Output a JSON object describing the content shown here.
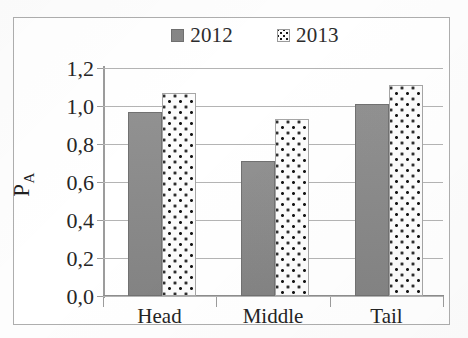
{
  "chart_data": {
    "type": "bar",
    "title": "",
    "subtitle": "",
    "xlabel": "",
    "ylabel": "P_A",
    "ylabel_base": "P",
    "ylabel_sub": "A",
    "categories": [
      "Head",
      "Middle",
      "Tail"
    ],
    "series": [
      {
        "name": "2012",
        "values": [
          0.97,
          0.71,
          1.01
        ],
        "color": "#8a8a8a",
        "pattern": "solid"
      },
      {
        "name": "2013",
        "values": [
          1.07,
          0.93,
          1.11
        ],
        "color": "#fcfcfc",
        "pattern": "dotted"
      }
    ],
    "ylim": [
      0.0,
      1.2
    ],
    "ytick_values": [
      1.2,
      1.0,
      0.8,
      0.6,
      0.4,
      0.2,
      0.0
    ],
    "ytick_labels": [
      "1,2",
      "1,0",
      "0,8",
      "0,6",
      "0,4",
      "0,2",
      "0,0"
    ],
    "decimal_separator": ",",
    "grid": true,
    "grid_axis": "y",
    "legend_position": "top",
    "legend_entries": [
      "2012",
      "2013"
    ],
    "frame": true
  },
  "legend": {
    "items": [
      {
        "label": "2012",
        "swatch": "solid-gray-swatch"
      },
      {
        "label": "2013",
        "swatch": "dotted-pattern-swatch"
      }
    ]
  },
  "axes": {
    "y": {
      "title_base": "P",
      "title_sub": "A",
      "ticks": [
        "1,2",
        "1,0",
        "0,8",
        "0,6",
        "0,4",
        "0,2",
        "0,0"
      ]
    },
    "x": {
      "ticks": [
        "Head",
        "Middle",
        "Tail"
      ]
    }
  },
  "colors": {
    "series_2012": "#8a8a8a",
    "series_2013": "#fcfcfc",
    "gridline": "#b4b4b4",
    "axis": "#9c9c9c",
    "frame_border": "#aeaeae",
    "text": "#242424",
    "background": "#ffffff"
  }
}
